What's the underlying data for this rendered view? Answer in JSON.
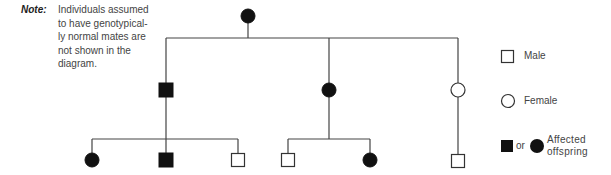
{
  "note": {
    "label": "Note:",
    "lines": [
      "Individuals assumed",
      "to have genotypical-",
      "ly normal mates are",
      "not shown in the",
      "diagram."
    ]
  },
  "pedigree": {
    "generations": [
      {
        "level": "I",
        "individuals": [
          {
            "id": "I-1",
            "sex": "female",
            "affected": true
          }
        ]
      },
      {
        "level": "II",
        "individuals": [
          {
            "id": "II-1",
            "sex": "male",
            "affected": true
          },
          {
            "id": "II-2",
            "sex": "female",
            "affected": true
          },
          {
            "id": "II-3",
            "sex": "female",
            "affected": false
          }
        ]
      },
      {
        "level": "III",
        "individuals": [
          {
            "id": "III-1",
            "sex": "female",
            "affected": true,
            "parent": "II-1"
          },
          {
            "id": "III-2",
            "sex": "male",
            "affected": true,
            "parent": "II-1"
          },
          {
            "id": "III-3",
            "sex": "male",
            "affected": false,
            "parent": "II-1"
          },
          {
            "id": "III-4",
            "sex": "male",
            "affected": false,
            "parent": "II-2"
          },
          {
            "id": "III-5",
            "sex": "female",
            "affected": true,
            "parent": "II-2"
          },
          {
            "id": "III-6",
            "sex": "male",
            "affected": false,
            "parent": "II-3"
          }
        ]
      }
    ],
    "line_color": "#444444",
    "fill_color": "#111111"
  },
  "legend": {
    "male": "Male",
    "female": "Female",
    "or": "or",
    "affected_line1": "Affected",
    "affected_line2": "offspring"
  }
}
